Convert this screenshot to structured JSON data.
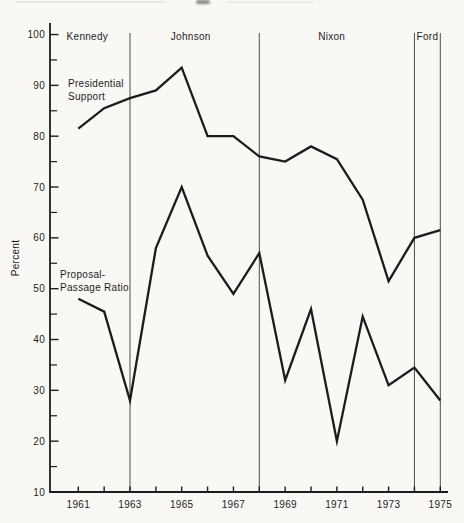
{
  "page": {
    "background": "#f9f8f5"
  },
  "chart_data": {
    "type": "line",
    "title": "",
    "xlabel": "",
    "ylabel": "Percent",
    "ylim": [
      10,
      100
    ],
    "xlim": [
      1959.9,
      1975.3
    ],
    "grid": false,
    "legend": "inline-labels",
    "x": [
      1961,
      1962,
      1963,
      1964,
      1965,
      1966,
      1967,
      1968,
      1969,
      1970,
      1971,
      1972,
      1973,
      1974,
      1975
    ],
    "x_labeled_years": [
      1961,
      1963,
      1965,
      1967,
      1969,
      1971,
      1973,
      1975
    ],
    "y_major_ticks": [
      10,
      20,
      30,
      40,
      50,
      60,
      70,
      80,
      90,
      100
    ],
    "y_minor_ticks": [
      15,
      25,
      35,
      45,
      55,
      65,
      75,
      85,
      95
    ],
    "series": [
      {
        "name": "Presidential Support",
        "label_lines": [
          "Presidential",
          "Support"
        ],
        "values": [
          81.5,
          85.5,
          87.5,
          89,
          93.5,
          80,
          80,
          76,
          75,
          78,
          75.5,
          67.5,
          51.5,
          60,
          61.5
        ]
      },
      {
        "name": "Proposal-Passage Ratio",
        "label_lines": [
          "Proposal-",
          "Passage Ratio"
        ],
        "values": [
          48,
          45.5,
          28,
          58,
          70,
          56.5,
          49,
          57,
          32,
          46,
          20,
          44.5,
          31,
          34.5,
          28
        ]
      }
    ],
    "era_dividers_years": [
      1963,
      1968,
      1974,
      1975
    ],
    "president_labels": [
      {
        "label": "Kennedy",
        "center_year": 1961.35
      },
      {
        "label": "Johnson",
        "center_year": 1965.35
      },
      {
        "label": "Nixon",
        "center_year": 1970.8
      },
      {
        "label": "Ford",
        "center_year": 1974.5
      }
    ],
    "colors": {
      "line": "#1c1c1c",
      "axis": "#1c1c1c",
      "divider": "#4d4d4d",
      "text": "#1d1d1d"
    }
  }
}
